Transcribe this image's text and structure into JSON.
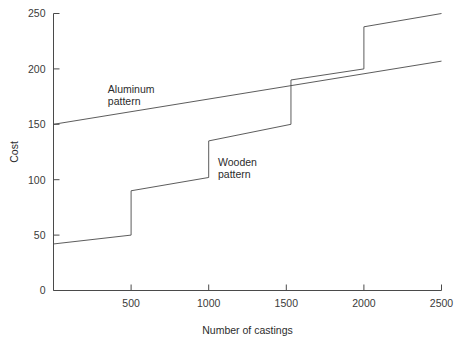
{
  "chart_data": {
    "type": "line",
    "title": "",
    "xlabel": "Number of castings",
    "ylabel": "Cost",
    "xlim": [
      0,
      2500
    ],
    "ylim": [
      0,
      250
    ],
    "xticks": [
      0,
      500,
      1000,
      1500,
      2000,
      2500
    ],
    "xtick_labels": [
      "",
      "500",
      "1000",
      "1500",
      "2000",
      "2500"
    ],
    "yticks": [
      0,
      50,
      100,
      150,
      200,
      250
    ],
    "ytick_labels": [
      "0",
      "50",
      "100",
      "150",
      "200",
      "250"
    ],
    "grid": false,
    "legend": "inline-annotations",
    "series": [
      {
        "name": "Aluminum pattern",
        "style": "linear",
        "points": [
          [
            0,
            150
          ],
          [
            2500,
            207
          ]
        ],
        "label_lines": [
          "Aluminum",
          "pattern"
        ],
        "label_x": 350,
        "label_y": 178
      },
      {
        "name": "Wooden pattern",
        "style": "step-with-slope",
        "points": [
          [
            0,
            42
          ],
          [
            500,
            50
          ],
          [
            500,
            90
          ],
          [
            1000,
            102
          ],
          [
            1000,
            135
          ],
          [
            1530,
            150
          ],
          [
            1530,
            190
          ],
          [
            2000,
            200
          ],
          [
            2000,
            238
          ],
          [
            2500,
            250
          ]
        ],
        "label_lines": [
          "Wooden",
          "pattern"
        ],
        "label_x": 1060,
        "label_y": 112
      }
    ]
  },
  "axes": {
    "y_axis_title": "Cost",
    "x_axis_title": "Number of castings"
  },
  "colors": {
    "line": "#4a4a4a",
    "text": "#2c2c2c",
    "background": "#ffffff"
  }
}
